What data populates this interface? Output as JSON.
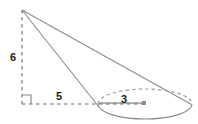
{
  "figure": {
    "type": "geometry-diagram",
    "background_color": "#ffffff",
    "stroke_color": "#8c8c8c",
    "dash_color": "#9a9a9a",
    "radius_line_color": "#6b6b6b",
    "label_color": "#1a1a1a",
    "width": 198,
    "height": 124,
    "labels": {
      "height_label": "6",
      "base_offset_label": "5",
      "radius_label": "3"
    },
    "points": {
      "apex": {
        "x": 22,
        "y": 10
      },
      "foot": {
        "x": 22,
        "y": 104
      },
      "center": {
        "x": 145,
        "y": 104
      },
      "center_dot": {
        "x": 144,
        "y": 103
      },
      "left_tangent": {
        "x": 98,
        "y": 104
      },
      "right_tangent": {
        "x": 191,
        "y": 104
      }
    },
    "ellipse": {
      "cx": 145,
      "cy": 104,
      "rx": 47,
      "ry": 15
    },
    "right_angle_marker": {
      "x": 22,
      "y": 104,
      "size": 9
    },
    "label_positions": {
      "height": {
        "x": 13,
        "y": 61
      },
      "base_offset": {
        "x": 59,
        "y": 100
      },
      "radius": {
        "x": 124,
        "y": 103
      }
    }
  }
}
